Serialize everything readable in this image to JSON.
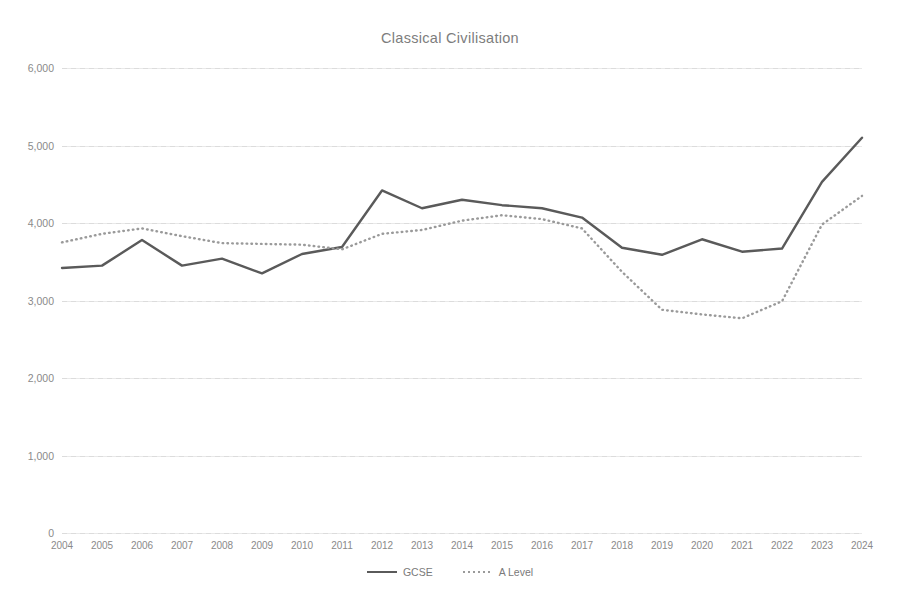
{
  "chart_data": {
    "type": "line",
    "title": "Classical Civilisation",
    "xlabel": "",
    "ylabel": "",
    "categories": [
      "2004",
      "2005",
      "2006",
      "2007",
      "2008",
      "2009",
      "2010",
      "2011",
      "2012",
      "2013",
      "2014",
      "2015",
      "2016",
      "2017",
      "2018",
      "2019",
      "2020",
      "2021",
      "2022",
      "2023",
      "2024"
    ],
    "series": [
      {
        "name": "GCSE",
        "style": "solid",
        "color": "#5a5a5a",
        "values": [
          3420,
          3450,
          3780,
          3450,
          3540,
          3350,
          3600,
          3690,
          4420,
          4190,
          4300,
          4230,
          4190,
          4070,
          3680,
          3590,
          3790,
          3630,
          3670,
          4530,
          5100
        ]
      },
      {
        "name": "A Level",
        "style": "dotted",
        "color": "#9a9a9a",
        "values": [
          3750,
          3860,
          3930,
          3830,
          3740,
          3730,
          3720,
          3660,
          3860,
          3910,
          4030,
          4100,
          4050,
          3930,
          3370,
          2880,
          2820,
          2770,
          2990,
          3980,
          4350
        ]
      }
    ],
    "ylim": [
      0,
      6000
    ],
    "ytick_values": [
      0,
      1000,
      2000,
      3000,
      4000,
      5000,
      6000
    ],
    "ytick_labels": [
      "0",
      "1,000",
      "2,000",
      "3,000",
      "4,000",
      "5,000",
      "6,000"
    ],
    "grid": true,
    "legend_position": "bottom"
  }
}
